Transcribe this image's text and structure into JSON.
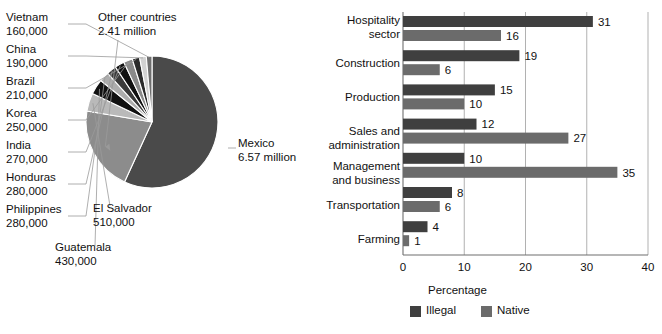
{
  "chart_data": [
    {
      "type": "pie",
      "title": "",
      "unit": "people",
      "legend_position": "callout-labels",
      "labels": [
        "Mexico",
        "Other countries",
        "El Salvador",
        "Guatemala",
        "Philippines",
        "Honduras",
        "India",
        "Korea",
        "Brazil",
        "China",
        "Vietnam"
      ],
      "value_labels": [
        "6.57 million",
        "2.41 million",
        "510,000",
        "430,000",
        "280,000",
        "280,000",
        "270,000",
        "250,000",
        "210,000",
        "190,000",
        "160,000"
      ],
      "values": [
        6570000,
        2410000,
        510000,
        430000,
        280000,
        280000,
        270000,
        250000,
        210000,
        190000,
        160000
      ],
      "colors": [
        "#4a4a4a",
        "#8c8c8c",
        "#b9b9b9",
        "#111111",
        "#adadad",
        "#3a3a3a",
        "#111111",
        "#8a8a8a",
        "#2b2b2b",
        "#d2d2d2",
        "#6e6e6e"
      ],
      "callouts": [
        {
          "name": "Mexico",
          "l1": "Mexico",
          "l2": "6.57 million",
          "side": "right"
        },
        {
          "name": "Other countries",
          "l1": "Other countries",
          "l2": "2.41 million",
          "side": "top"
        },
        {
          "name": "Vietnam",
          "l1": "Vietnam",
          "l2": "160,000",
          "side": "left"
        },
        {
          "name": "China",
          "l1": "China",
          "l2": "190,000",
          "side": "left"
        },
        {
          "name": "Brazil",
          "l1": "Brazil",
          "l2": "210,000",
          "side": "left"
        },
        {
          "name": "Korea",
          "l1": "Korea",
          "l2": "250,000",
          "side": "left"
        },
        {
          "name": "India",
          "l1": "India",
          "l2": "270,000",
          "side": "left"
        },
        {
          "name": "Honduras",
          "l1": "Honduras",
          "l2": "280,000",
          "side": "left"
        },
        {
          "name": "Philippines",
          "l1": "Philippines",
          "l2": "280,000",
          "side": "left"
        },
        {
          "name": "Guatemala",
          "l1": "Guatemala",
          "l2": "430,000",
          "side": "bottom"
        },
        {
          "name": "El Salvador",
          "l1": "El Salvador",
          "l2": "510,000",
          "side": "bottom"
        }
      ]
    },
    {
      "type": "bar",
      "orientation": "horizontal",
      "title": "",
      "xlabel": "Percentage",
      "ylabel": "",
      "xlim": [
        0,
        40
      ],
      "xticks": [
        0,
        10,
        20,
        30,
        40
      ],
      "xtick_labels": [
        "0",
        "10",
        "20",
        "30",
        "40"
      ],
      "grid": true,
      "grid_axis": "x",
      "legend_position": "bottom",
      "categories": [
        "Hospitality sector",
        "Construction",
        "Production",
        "Sales and administration",
        "Management and business",
        "Transportation",
        "Farming"
      ],
      "category_lines": [
        [
          "Hospitality",
          "sector"
        ],
        [
          "Construction",
          ""
        ],
        [
          "Production",
          ""
        ],
        [
          "Sales and",
          "administration"
        ],
        [
          "Management",
          "and business"
        ],
        [
          "Transportation",
          ""
        ],
        [
          "Farming",
          ""
        ]
      ],
      "series": [
        {
          "name": "Illegal",
          "color": "#3f3f3f",
          "values": [
            31,
            19,
            15,
            12,
            10,
            8,
            4
          ]
        },
        {
          "name": "Native",
          "color": "#6b6b6b",
          "values": [
            16,
            6,
            10,
            27,
            35,
            6,
            1
          ]
        }
      ]
    }
  ],
  "pie": {
    "callout_left": [
      {
        "l1": "Vietnam",
        "l2": "160,000"
      },
      {
        "l1": "China",
        "l2": "190,000"
      },
      {
        "l1": "Brazil",
        "l2": "210,000"
      },
      {
        "l1": "Korea",
        "l2": "250,000"
      },
      {
        "l1": "India",
        "l2": "270,000"
      },
      {
        "l1": "Honduras",
        "l2": "280,000"
      },
      {
        "l1": "Philippines",
        "l2": "280,000"
      }
    ],
    "callout_top": {
      "l1": "Other countries",
      "l2": "2.41 million"
    },
    "callout_right": {
      "l1": "Mexico",
      "l2": "6.57 million"
    },
    "callout_guatemala": {
      "l1": "Guatemala",
      "l2": "430,000"
    },
    "callout_elsalvador": {
      "l1": "El Salvador",
      "l2": "510,000"
    }
  },
  "bar": {
    "xlabel": "Percentage",
    "xtick_labels": [
      "0",
      "10",
      "20",
      "30",
      "40"
    ],
    "legend": [
      {
        "label": "Illegal",
        "color": "#3f3f3f"
      },
      {
        "label": "Native",
        "color": "#6b6b6b"
      }
    ],
    "rows": [
      {
        "line1": "Hospitality",
        "line2": "sector",
        "illegal": "31",
        "native": "16"
      },
      {
        "line1": "Construction",
        "line2": "",
        "illegal": "19",
        "native": "6"
      },
      {
        "line1": "Production",
        "line2": "",
        "illegal": "15",
        "native": "10"
      },
      {
        "line1": "Sales and",
        "line2": "administration",
        "illegal": "12",
        "native": "27"
      },
      {
        "line1": "Management",
        "line2": "and business",
        "illegal": "10",
        "native": "35"
      },
      {
        "line1": "Transportation",
        "line2": "",
        "illegal": "8",
        "native": "6"
      },
      {
        "line1": "Farming",
        "line2": "",
        "illegal": "4",
        "native": "1"
      }
    ]
  },
  "colors": {
    "illegal": "#3f3f3f",
    "native": "#6b6b6b",
    "pie_mexico": "#4a4a4a",
    "pie_other": "#8c8c8c",
    "axis": "#7a7a7a",
    "text": "#111111"
  }
}
